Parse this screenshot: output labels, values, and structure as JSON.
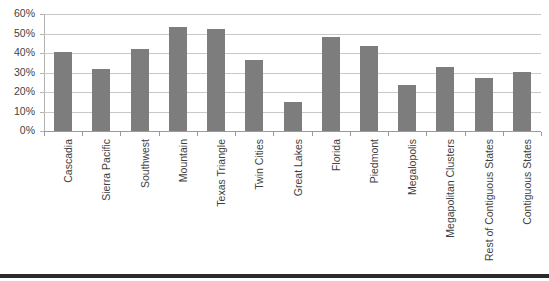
{
  "chart_data": {
    "type": "bar",
    "title": "",
    "subtitle": "",
    "xlabel": "",
    "ylabel": "",
    "ylim": [
      0,
      60
    ],
    "ytick_step": 10,
    "ytick_labels": [
      "0%",
      "10%",
      "20%",
      "30%",
      "40%",
      "50%",
      "60%"
    ],
    "ytick_values": [
      0,
      10,
      20,
      30,
      40,
      50,
      60
    ],
    "value_format": "percent",
    "grid": true,
    "legend": null,
    "legend_position": "none",
    "series_name": "",
    "bar_color": "#7d7d7d",
    "gridline_color": "#c8c8c8",
    "axis_color": "#9a9a9a",
    "categories": [
      "Cascadia",
      "Sierra Pacific",
      "Southwest",
      "Mountain",
      "Texas Triangle",
      "Twin Cities",
      "Great Lakes",
      "Florida",
      "Piedmont",
      "Megalopolis",
      "Megapolitan Clusters",
      "Rest of Contiguous States",
      "Contiguous States"
    ],
    "values": [
      40.3,
      31.8,
      41.8,
      53.3,
      52.3,
      36.2,
      14.8,
      48.0,
      43.5,
      23.7,
      32.8,
      27.4,
      30.0
    ]
  }
}
